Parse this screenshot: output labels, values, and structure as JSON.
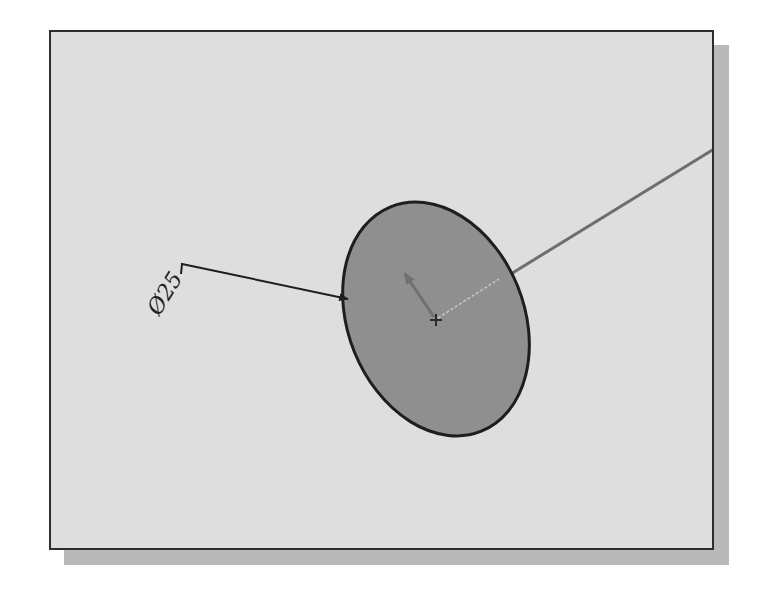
{
  "view": {
    "background_color": "#dedede",
    "frame_color": "#2e2e2e",
    "shadow_color": "#b9b9b9"
  },
  "sketch": {
    "circle": {
      "fill_color": "#8f8f8f",
      "stroke_color": "#1e1e1e",
      "center": [
        434,
        317
      ],
      "rx": 88,
      "ry": 121,
      "rotation_deg": -22
    },
    "dimension": {
      "label": "Ø25",
      "symbol": "Ø",
      "value": "25",
      "leader_color": "#1e1e1e"
    },
    "construction_line": {
      "color": "#6e6e6e"
    },
    "axis_arrow": {
      "color": "#707070"
    },
    "center_point": {
      "color": "#2a2a2a"
    }
  }
}
